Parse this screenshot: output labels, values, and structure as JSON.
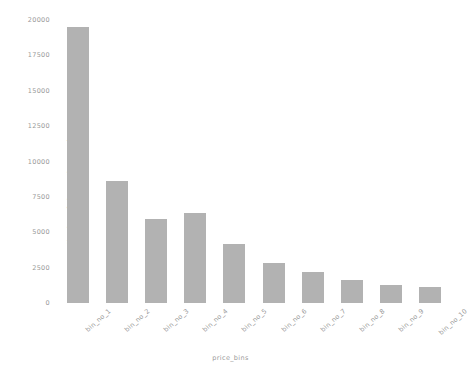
{
  "chart_data": {
    "type": "bar",
    "title": "",
    "xlabel": "price_bins",
    "ylabel": "Number of observations per bar",
    "categories": [
      "bin_no_1",
      "bin_no_2",
      "bin_no_3",
      "bin_no_4",
      "bin_no_5",
      "bin_no_6",
      "bin_no_7",
      "bin_no_8",
      "bin_no_9",
      "bin_no_10"
    ],
    "values": [
      19500,
      8600,
      5950,
      6350,
      4200,
      2850,
      2200,
      1650,
      1300,
      1100
    ],
    "ylim": [
      0,
      20000
    ],
    "yticks": [
      0,
      2500,
      5000,
      7500,
      10000,
      12500,
      15000,
      17500,
      20000
    ],
    "ytick_labels": [
      "0",
      "2500",
      "5000",
      "7500",
      "10000",
      "12500",
      "15000",
      "17500",
      "20000"
    ],
    "grid": false,
    "legend": "none",
    "bar_color": "#b2b2b2",
    "text_color": "#9a9a9a",
    "background": "#ffffff"
  }
}
